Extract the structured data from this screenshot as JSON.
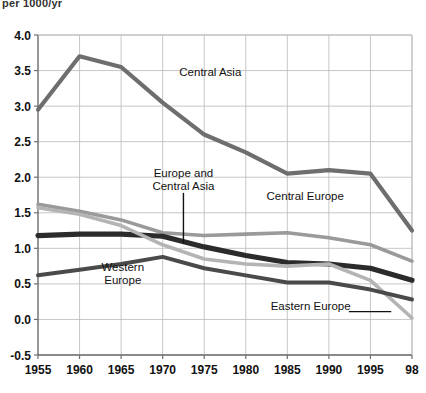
{
  "unit_label": "per 1000/yr",
  "chart_data": {
    "type": "line",
    "title": "",
    "subtitle": "",
    "xlabel": "",
    "ylabel": "per 1000/yr",
    "x": [
      1955,
      1960,
      1965,
      1970,
      1975,
      1980,
      1985,
      1990,
      1995,
      1998
    ],
    "xtick_labels": [
      "1955",
      "1960",
      "1965",
      "1970",
      "1975",
      "1980",
      "1985",
      "1990",
      "1995",
      "98"
    ],
    "ytick_labels": [
      "4.0",
      "3.5",
      "3.0",
      "2.5",
      "2.0",
      "1.5",
      "1.0",
      "0.5",
      "0.0",
      "-0.5"
    ],
    "ytick_values": [
      4.0,
      3.5,
      3.0,
      2.5,
      2.0,
      1.5,
      1.0,
      0.5,
      0.0,
      -0.5
    ],
    "xlim": [
      1955,
      1998
    ],
    "ylim": [
      -0.5,
      4.0
    ],
    "grid": true,
    "legend": "inline-annotations",
    "series": [
      {
        "name": "Central Asia",
        "color": "#6e6e6e",
        "width": 4.2,
        "values": [
          2.95,
          3.7,
          3.55,
          3.05,
          2.6,
          2.35,
          2.05,
          2.1,
          2.05,
          1.25
        ]
      },
      {
        "name": "Central Europe",
        "color": "#9a9a9a",
        "width": 3.6,
        "values": [
          1.62,
          1.52,
          1.4,
          1.22,
          1.18,
          1.2,
          1.22,
          1.15,
          1.05,
          0.82
        ]
      },
      {
        "name": "Europe and Central Asia",
        "color": "#2b2b2b",
        "width": 5.2,
        "values": [
          1.18,
          1.2,
          1.2,
          1.17,
          1.02,
          0.9,
          0.8,
          0.78,
          0.72,
          0.55
        ]
      },
      {
        "name": "Eastern Europe",
        "color": "#b4b4b4",
        "width": 3.6,
        "values": [
          1.57,
          1.48,
          1.32,
          1.05,
          0.85,
          0.78,
          0.75,
          0.78,
          0.55,
          0.02
        ]
      },
      {
        "name": "Western Europe",
        "color": "#4a4a4a",
        "width": 4.0,
        "values": [
          0.62,
          0.7,
          0.78,
          0.88,
          0.72,
          0.62,
          0.52,
          0.52,
          0.42,
          0.28
        ]
      }
    ],
    "annotations": [
      {
        "name": "central-asia",
        "text": "Central Asia",
        "x": 1972.0,
        "y": 3.42,
        "align": "start",
        "leader": null
      },
      {
        "name": "europe-and-central-asia",
        "text_lines": [
          "Europe and",
          "Central Asia"
        ],
        "x": 1972.5,
        "y": 2.0,
        "align": "middle",
        "leader": {
          "x1": 1972.5,
          "y1": 1.78,
          "x2": 1972.5,
          "y2": 1.07
        }
      },
      {
        "name": "central-europe",
        "text": "Central Europe",
        "x": 1982.5,
        "y": 1.68,
        "align": "start",
        "leader": null
      },
      {
        "name": "western-europe",
        "text_lines": [
          "Western",
          "Europe"
        ],
        "x": 1965.2,
        "y": 0.68,
        "align": "middle",
        "leader": null
      },
      {
        "name": "eastern-europe",
        "text": "Eastern Europe",
        "x": 1983.0,
        "y": 0.13,
        "align": "start",
        "leader": {
          "x1": 1992.4,
          "y1": 0.11,
          "x2": 1996.5,
          "y2": 0.11
        }
      }
    ]
  }
}
